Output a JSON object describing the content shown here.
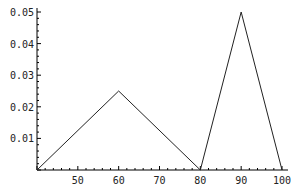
{
  "chart_data": {
    "type": "line",
    "title": "",
    "xlabel": "",
    "ylabel": "",
    "xlim": [
      40,
      100
    ],
    "ylim": [
      0,
      0.05
    ],
    "grid": false,
    "legend": null,
    "x_ticks": [
      "50",
      "60",
      "70",
      "80",
      "90",
      "100"
    ],
    "y_ticks": [
      "0.01",
      "0.02",
      "0.03",
      "0.04",
      "0.05"
    ],
    "series": [
      {
        "name": "triangular density",
        "x": [
          40,
          60,
          80,
          90,
          100
        ],
        "y": [
          0,
          0.025,
          0,
          0.05,
          0
        ]
      }
    ]
  }
}
